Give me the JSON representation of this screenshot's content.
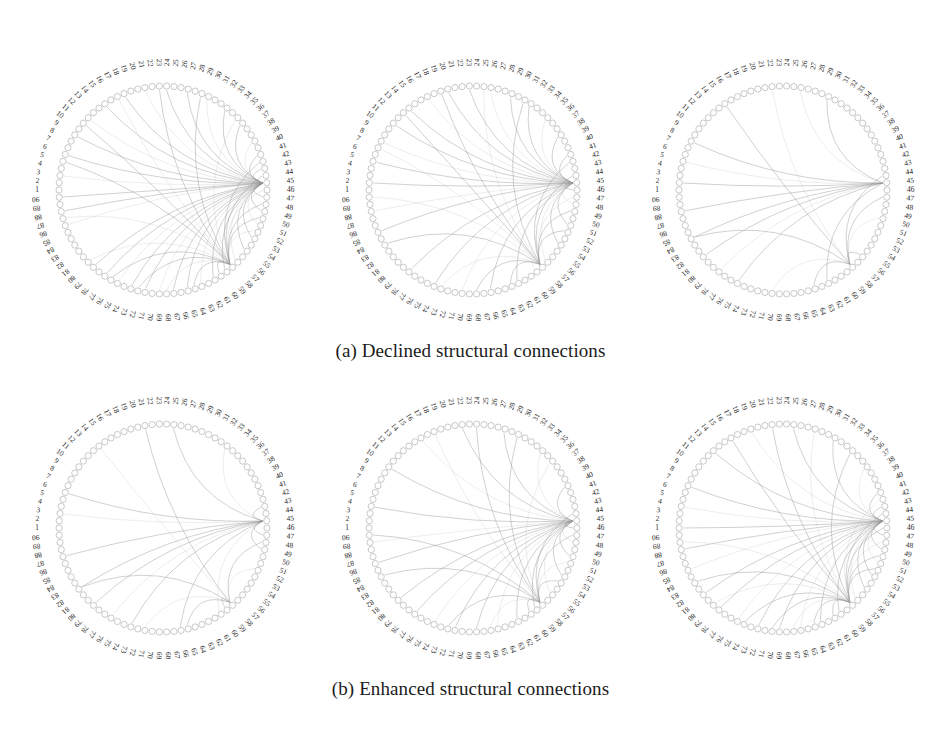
{
  "figure": {
    "background": "#ffffff",
    "node_count": 90,
    "node_color": "#c2c2c2",
    "edge_color": "#8f8f8f",
    "label_color": "#262626",
    "node_labels": [
      "1",
      "2",
      "3",
      "4",
      "5",
      "6",
      "7",
      "8",
      "9",
      "10",
      "11",
      "12",
      "13",
      "14",
      "15",
      "16",
      "17",
      "18",
      "19",
      "20",
      "21",
      "22",
      "23",
      "24",
      "25",
      "26",
      "27",
      "28",
      "29",
      "30",
      "31",
      "32",
      "33",
      "34",
      "35",
      "36",
      "37",
      "38",
      "39",
      "40",
      "41",
      "42",
      "43",
      "44",
      "45",
      "46",
      "47",
      "48",
      "49",
      "50",
      "51",
      "52",
      "53",
      "54",
      "55",
      "56",
      "57",
      "58",
      "59",
      "60",
      "61",
      "62",
      "63",
      "64",
      "65",
      "66",
      "67",
      "68",
      "69",
      "70",
      "71",
      "72",
      "73",
      "74",
      "75",
      "76",
      "77",
      "78",
      "79",
      "80",
      "81",
      "82",
      "83",
      "84",
      "85",
      "86",
      "87",
      "88",
      "89",
      "90"
    ]
  },
  "captions": {
    "a": "(a) Declined structural connections",
    "b": "(b) Enhanced structural connections"
  },
  "chart_data": {
    "type": "graph",
    "layout": "circular-connectogram",
    "title": "",
    "panels": [
      {
        "id": "a1",
        "row": "a",
        "column": 1,
        "caption_group": "(a) Declined structural connections",
        "center": [
          163,
          190
        ],
        "node_radius": 104,
        "label_radius": 124,
        "hub_nodes": [
          45,
          58
        ],
        "edges": [
          [
            45,
            79
          ],
          [
            45,
            77
          ],
          [
            45,
            75
          ],
          [
            45,
            73
          ],
          [
            45,
            71
          ],
          [
            45,
            69
          ],
          [
            45,
            67
          ],
          [
            45,
            65
          ],
          [
            45,
            63
          ],
          [
            45,
            61
          ],
          [
            45,
            59
          ],
          [
            45,
            57
          ],
          [
            45,
            55
          ],
          [
            45,
            53
          ],
          [
            45,
            51
          ],
          [
            45,
            49
          ],
          [
            45,
            47
          ],
          [
            45,
            86
          ],
          [
            45,
            88
          ],
          [
            45,
            90
          ],
          [
            45,
            3
          ],
          [
            45,
            6
          ],
          [
            45,
            9
          ],
          [
            45,
            12
          ],
          [
            45,
            15
          ],
          [
            45,
            18
          ],
          [
            45,
            21
          ],
          [
            45,
            24
          ],
          [
            45,
            27
          ],
          [
            45,
            30
          ],
          [
            45,
            33
          ],
          [
            45,
            36
          ],
          [
            45,
            39
          ],
          [
            45,
            41
          ],
          [
            45,
            43
          ],
          [
            58,
            80
          ],
          [
            58,
            76
          ],
          [
            58,
            72
          ],
          [
            58,
            68
          ],
          [
            58,
            64
          ],
          [
            58,
            60
          ],
          [
            58,
            52
          ],
          [
            58,
            50
          ],
          [
            58,
            48
          ],
          [
            58,
            46
          ],
          [
            58,
            44
          ],
          [
            58,
            42
          ],
          [
            58,
            87
          ],
          [
            58,
            5
          ],
          [
            58,
            11
          ],
          [
            58,
            17
          ],
          [
            58,
            23
          ],
          [
            58,
            29
          ],
          [
            58,
            35
          ]
        ],
        "edge_count": 54
      },
      {
        "id": "a2",
        "row": "a",
        "column": 2,
        "caption_group": "(a) Declined structural connections",
        "center": [
          473,
          190
        ],
        "node_radius": 104,
        "label_radius": 124,
        "hub_nodes": [
          45,
          58
        ],
        "edges": [
          [
            45,
            78
          ],
          [
            45,
            74
          ],
          [
            45,
            70
          ],
          [
            45,
            66
          ],
          [
            45,
            62
          ],
          [
            45,
            57
          ],
          [
            45,
            54
          ],
          [
            45,
            51
          ],
          [
            45,
            48
          ],
          [
            45,
            46
          ],
          [
            45,
            85
          ],
          [
            45,
            88
          ],
          [
            45,
            2
          ],
          [
            45,
            5
          ],
          [
            45,
            8
          ],
          [
            45,
            11
          ],
          [
            45,
            14
          ],
          [
            45,
            17
          ],
          [
            45,
            20
          ],
          [
            45,
            23
          ],
          [
            45,
            26
          ],
          [
            45,
            29
          ],
          [
            45,
            32
          ],
          [
            45,
            35
          ],
          [
            45,
            38
          ],
          [
            45,
            41
          ],
          [
            58,
            73
          ],
          [
            58,
            68
          ],
          [
            58,
            63
          ],
          [
            58,
            59
          ],
          [
            58,
            52
          ],
          [
            58,
            49
          ],
          [
            58,
            47
          ],
          [
            58,
            44
          ],
          [
            58,
            42
          ],
          [
            58,
            7
          ],
          [
            58,
            13
          ],
          [
            58,
            19
          ],
          [
            58,
            25
          ],
          [
            58,
            31
          ],
          [
            58,
            83
          ],
          [
            58,
            90
          ]
        ],
        "edge_count": 42
      },
      {
        "id": "a3",
        "row": "a",
        "column": 3,
        "caption_group": "(a) Declined structural connections",
        "center": [
          783,
          190
        ],
        "node_radius": 104,
        "label_radius": 124,
        "hub_nodes": [
          45,
          58
        ],
        "edges": [
          [
            45,
            84
          ],
          [
            45,
            81
          ],
          [
            45,
            78
          ],
          [
            45,
            75
          ],
          [
            45,
            8
          ],
          [
            45,
            5
          ],
          [
            45,
            2
          ],
          [
            45,
            88
          ],
          [
            58,
            70
          ],
          [
            58,
            64
          ],
          [
            58,
            56
          ],
          [
            58,
            50
          ],
          [
            58,
            47
          ],
          [
            58,
            44
          ],
          [
            58,
            22
          ],
          [
            58,
            15
          ],
          [
            58,
            84
          ],
          [
            45,
            26
          ],
          [
            45,
            30
          ],
          [
            45,
            62
          ]
        ],
        "edge_count": 20
      },
      {
        "id": "b1",
        "row": "b",
        "column": 1,
        "caption_group": "(b) Enhanced structural connections",
        "center": [
          163,
          528
        ],
        "node_radius": 104,
        "label_radius": 124,
        "hub_nodes": [
          45,
          58
        ],
        "edges": [
          [
            45,
            82
          ],
          [
            45,
            79
          ],
          [
            45,
            76
          ],
          [
            45,
            73
          ],
          [
            45,
            66
          ],
          [
            45,
            60
          ],
          [
            45,
            49
          ],
          [
            45,
            47
          ],
          [
            45,
            3
          ],
          [
            45,
            6
          ],
          [
            45,
            87
          ],
          [
            58,
            71
          ],
          [
            58,
            65
          ],
          [
            58,
            59
          ],
          [
            58,
            52
          ],
          [
            58,
            48
          ],
          [
            58,
            21
          ],
          [
            58,
            14
          ],
          [
            58,
            82
          ],
          [
            45,
            25
          ],
          [
            45,
            33
          ],
          [
            45,
            43
          ]
        ],
        "edge_count": 22
      },
      {
        "id": "b2",
        "row": "b",
        "column": 2,
        "caption_group": "(b) Enhanced structural connections",
        "center": [
          473,
          528
        ],
        "node_radius": 104,
        "label_radius": 124,
        "hub_nodes": [
          45,
          58
        ],
        "edges": [
          [
            45,
            80
          ],
          [
            45,
            77
          ],
          [
            45,
            74
          ],
          [
            45,
            71
          ],
          [
            45,
            68
          ],
          [
            45,
            65
          ],
          [
            45,
            62
          ],
          [
            45,
            59
          ],
          [
            45,
            56
          ],
          [
            45,
            53
          ],
          [
            45,
            50
          ],
          [
            45,
            48
          ],
          [
            45,
            46
          ],
          [
            45,
            86
          ],
          [
            45,
            89
          ],
          [
            45,
            4
          ],
          [
            45,
            10
          ],
          [
            45,
            16
          ],
          [
            45,
            22
          ],
          [
            45,
            28
          ],
          [
            45,
            34
          ],
          [
            45,
            40
          ],
          [
            58,
            72
          ],
          [
            58,
            66
          ],
          [
            58,
            60
          ],
          [
            58,
            54
          ],
          [
            58,
            51
          ],
          [
            58,
            47
          ],
          [
            58,
            44
          ],
          [
            58,
            18
          ],
          [
            58,
            24
          ],
          [
            58,
            30
          ],
          [
            58,
            36
          ],
          [
            58,
            84
          ],
          [
            58,
            90
          ]
        ],
        "edge_count": 35
      },
      {
        "id": "b3",
        "row": "b",
        "column": 3,
        "caption_group": "(b) Enhanced structural connections",
        "center": [
          783,
          528
        ],
        "node_radius": 104,
        "label_radius": 124,
        "hub_nodes": [
          45,
          58
        ],
        "edges": [
          [
            45,
            81
          ],
          [
            45,
            78
          ],
          [
            45,
            75
          ],
          [
            45,
            72
          ],
          [
            45,
            69
          ],
          [
            45,
            66
          ],
          [
            45,
            63
          ],
          [
            45,
            60
          ],
          [
            45,
            57
          ],
          [
            45,
            55
          ],
          [
            45,
            53
          ],
          [
            45,
            51
          ],
          [
            45,
            49
          ],
          [
            45,
            47
          ],
          [
            45,
            85
          ],
          [
            45,
            88
          ],
          [
            45,
            1
          ],
          [
            45,
            4
          ],
          [
            45,
            7
          ],
          [
            45,
            13
          ],
          [
            45,
            19
          ],
          [
            45,
            25
          ],
          [
            45,
            31
          ],
          [
            45,
            37
          ],
          [
            45,
            41
          ],
          [
            45,
            43
          ],
          [
            58,
            79
          ],
          [
            58,
            74
          ],
          [
            58,
            70
          ],
          [
            58,
            67
          ],
          [
            58,
            64
          ],
          [
            58,
            61
          ],
          [
            58,
            58
          ],
          [
            58,
            52
          ],
          [
            58,
            50
          ],
          [
            58,
            48
          ],
          [
            58,
            46
          ],
          [
            58,
            44
          ],
          [
            58,
            42
          ],
          [
            58,
            16
          ],
          [
            58,
            22
          ],
          [
            58,
            28
          ],
          [
            58,
            34
          ],
          [
            58,
            83
          ],
          [
            58,
            89
          ]
        ],
        "edge_count": 45
      }
    ],
    "axis_ranges": {
      "node_index_min": 1,
      "node_index_max": 90
    },
    "grid": false,
    "legend": "none"
  }
}
